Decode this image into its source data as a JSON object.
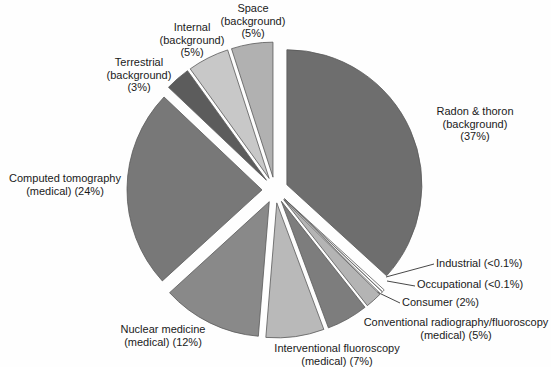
{
  "figure": {
    "kind": "exploded pie chart (grayscale print figure)",
    "background_color": "#fefefe",
    "text_color": "#1a1a1a",
    "outline_color": "#595959"
  },
  "chart_data": {
    "type": "pie",
    "title": "",
    "unit": "percent of total radiation exposure",
    "direction": "clockwise",
    "start_angle_deg": 0,
    "legend": "none",
    "grid": false,
    "slices": [
      {
        "name": "Radon & thoron (background)",
        "value": 37,
        "display": "37%",
        "color": "#6e6e6e",
        "label_lines": [
          "Radon & thoron",
          "(background)",
          "(37%)"
        ]
      },
      {
        "name": "Industrial",
        "value": 0.1,
        "display": "<0.1%",
        "color": "#ffffff",
        "label_lines": [
          "Industrial (<0.1%)"
        ]
      },
      {
        "name": "Occupational",
        "value": 0.1,
        "display": "<0.1%",
        "color": "#ffffff",
        "label_lines": [
          "Occupational (<0.1%)"
        ]
      },
      {
        "name": "Consumer",
        "value": 2,
        "display": "2%",
        "color": "#b4b4b4",
        "label_lines": [
          "Consumer (2%)"
        ]
      },
      {
        "name": "Conventional radiography/fluoroscopy (medical)",
        "value": 5,
        "display": "5%",
        "color": "#7d7d7d",
        "label_lines": [
          "Conventional radiography/fluoroscopy",
          "(medical) (5%)"
        ]
      },
      {
        "name": "Interventional fluoroscopy (medical)",
        "value": 7,
        "display": "7%",
        "color": "#b9b9b9",
        "label_lines": [
          "Interventional fluoroscopy",
          "(medical) (7%)"
        ]
      },
      {
        "name": "Nuclear medicine (medical)",
        "value": 12,
        "display": "12%",
        "color": "#898989",
        "label_lines": [
          "Nuclear medicine",
          "(medical) (12%)"
        ]
      },
      {
        "name": "Computed tomography (medical)",
        "value": 24,
        "display": "24%",
        "color": "#787878",
        "label_lines": [
          "Computed tomography",
          "(medical) (24%)"
        ]
      },
      {
        "name": "Terrestrial (background)",
        "value": 3,
        "display": "3%",
        "color": "#5c5c5c",
        "label_lines": [
          "Terrestrial",
          "(background)",
          "(3%)"
        ]
      },
      {
        "name": "Internal (background)",
        "value": 5,
        "display": "5%",
        "color": "#c8c8c8",
        "label_lines": [
          "Internal",
          "(background)",
          "(5%)"
        ]
      },
      {
        "name": "Space (background)",
        "value": 5,
        "display": "5%",
        "color": "#b1b1b1",
        "label_lines": [
          "Space",
          "(background)",
          "(5%)"
        ]
      }
    ]
  }
}
